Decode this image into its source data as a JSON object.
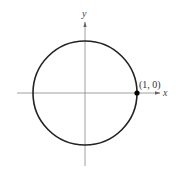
{
  "diagram": {
    "type": "unit-circle",
    "axes": {
      "x_label": "x",
      "y_label": "y"
    },
    "circle": {
      "center": [
        0,
        0
      ],
      "radius": 1
    },
    "points": [
      {
        "label": "(1, 0)",
        "x": 1,
        "y": 0
      }
    ],
    "colors": {
      "axis": "#888888",
      "circle": "#222222",
      "point": "#000000"
    }
  }
}
